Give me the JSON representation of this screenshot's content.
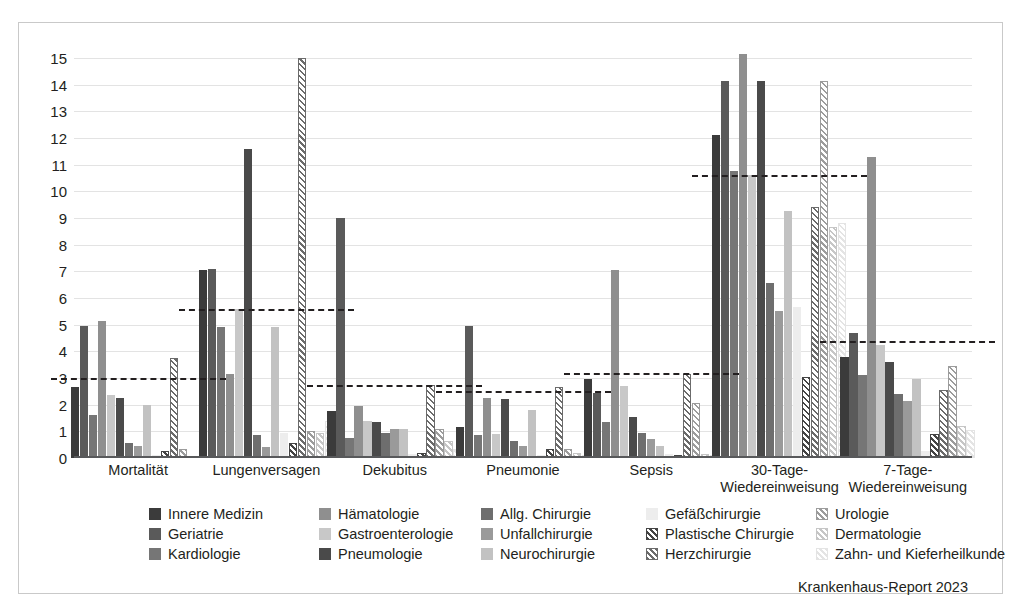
{
  "source_note": "Krankenhaus-Report 2023",
  "chart_data": {
    "type": "bar",
    "title": "",
    "xlabel": "",
    "ylabel": "",
    "ylim": [
      0,
      15
    ],
    "yticks": [
      0,
      1,
      2,
      3,
      4,
      5,
      6,
      7,
      8,
      9,
      10,
      11,
      12,
      13,
      14,
      15
    ],
    "grid": true,
    "legend_position": "bottom",
    "categories": [
      "Mortalität",
      "Lungenversagen",
      "Dekubitus",
      "Pneumonie",
      "Sepsis",
      "30-Tage-\nWiedereinweisung",
      "7-Tage-\nWiedereinweisung"
    ],
    "average_line_label": "Durchschnitt",
    "average_values": [
      3.0,
      5.6,
      2.75,
      2.5,
      3.2,
      10.6,
      4.4
    ],
    "series": [
      {
        "name": "Innere Medizin",
        "color": "#3b3b3b",
        "pattern": "solid",
        "values": [
          2.65,
          7.05,
          1.75,
          1.15,
          2.95,
          12.1,
          3.8
        ]
      },
      {
        "name": "Geriatrie",
        "color": "#5a5a5a",
        "pattern": "solid",
        "values": [
          4.95,
          7.1,
          9.0,
          4.95,
          2.45,
          14.15,
          4.7
        ]
      },
      {
        "name": "Kardiologie",
        "color": "#767676",
        "pattern": "solid",
        "values": [
          1.6,
          4.9,
          0.75,
          0.85,
          1.35,
          10.75,
          3.1
        ]
      },
      {
        "name": "Hämatologie",
        "color": "#8f8f8f",
        "pattern": "solid",
        "values": [
          5.15,
          3.15,
          1.95,
          2.25,
          7.05,
          15.15,
          11.3
        ]
      },
      {
        "name": "Gastroenterologie",
        "color": "#c8c8c8",
        "pattern": "solid",
        "values": [
          2.35,
          5.6,
          1.4,
          0.9,
          2.7,
          10.6,
          4.25
        ]
      },
      {
        "name": "Pneumologie",
        "color": "#4a4a4a",
        "pattern": "solid",
        "values": [
          2.25,
          11.6,
          1.35,
          2.2,
          1.55,
          14.15,
          3.6
        ]
      },
      {
        "name": "Allg. Chirurgie",
        "color": "#6e6e6e",
        "pattern": "solid",
        "values": [
          0.55,
          0.85,
          0.95,
          0.65,
          0.95,
          6.55,
          2.4
        ]
      },
      {
        "name": "Unfallchirurgie",
        "color": "#9a9a9a",
        "pattern": "solid",
        "values": [
          0.45,
          0.4,
          1.1,
          0.45,
          0.7,
          5.5,
          2.15
        ]
      },
      {
        "name": "Neurochirurgie",
        "color": "#c2c2c2",
        "pattern": "solid",
        "values": [
          2.0,
          4.9,
          1.1,
          1.8,
          0.45,
          9.25,
          2.95
        ]
      },
      {
        "name": "Gefäßchirurgie",
        "color": "#ededed",
        "pattern": "solid",
        "values": [
          0.1,
          0.95,
          0.15,
          0.1,
          0.15,
          5.65,
          0.25
        ]
      },
      {
        "name": "Plastische Chirurgie",
        "color": "#444444",
        "pattern": "hatch",
        "values": [
          0.25,
          0.55,
          0.2,
          0.35,
          0.1,
          3.05,
          0.9
        ]
      },
      {
        "name": "Herzchirurgie",
        "color": "#6b6b6b",
        "pattern": "hatch",
        "values": [
          3.75,
          15.0,
          2.75,
          2.65,
          3.15,
          9.4,
          2.55
        ]
      },
      {
        "name": "Urologie",
        "color": "#9c9c9c",
        "pattern": "hatch",
        "values": [
          0.35,
          1.0,
          1.1,
          0.35,
          2.05,
          14.15,
          3.45
        ]
      },
      {
        "name": "Dermatologie",
        "color": "#c6c6c6",
        "pattern": "hatch",
        "values": [
          0.05,
          0.95,
          0.65,
          0.2,
          0.15,
          8.65,
          1.2
        ]
      },
      {
        "name": "Zahn- und Kieferheilkunde",
        "color": "#e4e4e4",
        "pattern": "hatch",
        "values": [
          0.05,
          1.4,
          0.35,
          0.1,
          0.1,
          8.8,
          1.05
        ]
      }
    ]
  }
}
